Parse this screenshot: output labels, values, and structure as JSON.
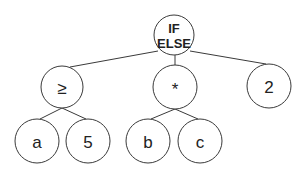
{
  "diagram": {
    "type": "expression-tree",
    "colors": {
      "stroke": "#3a3a3a",
      "text": "#222222",
      "background": "#ffffff"
    },
    "nodes": [
      {
        "id": "root",
        "label_line1": "IF",
        "label_line2": "ELSE",
        "cx": 174,
        "cy": 35,
        "r": 20
      },
      {
        "id": "gte",
        "label": "≥",
        "cx": 62,
        "cy": 87,
        "r": 21
      },
      {
        "id": "mul",
        "label": "*",
        "cx": 175,
        "cy": 87,
        "r": 22
      },
      {
        "id": "two",
        "label": "2",
        "cx": 269,
        "cy": 86,
        "r": 22
      },
      {
        "id": "a",
        "label": "a",
        "cx": 37,
        "cy": 141,
        "r": 22
      },
      {
        "id": "five",
        "label": "5",
        "cx": 88,
        "cy": 141,
        "r": 22
      },
      {
        "id": "b",
        "label": "b",
        "cx": 148,
        "cy": 141,
        "r": 22
      },
      {
        "id": "c",
        "label": "c",
        "cx": 200,
        "cy": 141,
        "r": 22
      }
    ],
    "edges": [
      {
        "from": "root",
        "to": "gte"
      },
      {
        "from": "root",
        "to": "mul"
      },
      {
        "from": "root",
        "to": "two"
      },
      {
        "from": "gte",
        "to": "a"
      },
      {
        "from": "gte",
        "to": "five"
      },
      {
        "from": "mul",
        "to": "b"
      },
      {
        "from": "mul",
        "to": "c"
      }
    ]
  }
}
